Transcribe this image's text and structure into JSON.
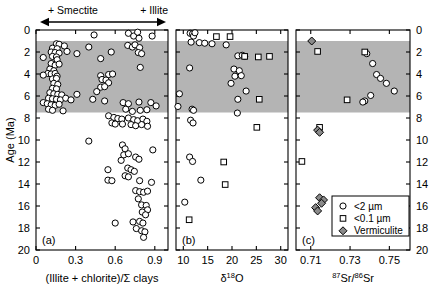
{
  "figure": {
    "yaxis": {
      "label": "Age (Ma)",
      "ticks": [
        0,
        2,
        4,
        6,
        8,
        10,
        12,
        14,
        16,
        18,
        20
      ],
      "min": 0,
      "max": 20,
      "direction": "inverted"
    },
    "shaded_band": {
      "label": "",
      "y_top": 1.0,
      "y_bottom": 7.5,
      "color": "#b4b4b4"
    },
    "annotations": {
      "left_arrow_label": "+ Smectite",
      "right_arrow_label": "+ Illite"
    },
    "legend": {
      "items": [
        {
          "symbol": "circle",
          "label": "<2 µm"
        },
        {
          "symbol": "square",
          "label": "<0.1 µm"
        },
        {
          "symbol": "diamond",
          "label": "Vermiculite"
        }
      ]
    }
  },
  "chart_data": [
    {
      "type": "scatter",
      "panel": "(a)",
      "title": "",
      "xlabel": "(Illite + chlorite)/Σ clays",
      "ylabel": "Age (Ma)",
      "xlim": [
        0,
        1.0
      ],
      "ylim": [
        20,
        0
      ],
      "xticks": [
        0,
        0.3,
        0.6,
        0.9
      ],
      "xticklabels": [
        "0",
        "0.3",
        "0.6",
        "0.9"
      ],
      "yticks": [
        0,
        2,
        4,
        6,
        8,
        10,
        12,
        14,
        16,
        18,
        20
      ],
      "grid": false,
      "series": [
        {
          "name": "<2 µm",
          "symbol": "circle",
          "points": [
            [
              0.44,
              0.45
            ],
            [
              0.7,
              0.3
            ],
            [
              0.74,
              0.55
            ],
            [
              0.77,
              0.2
            ],
            [
              0.78,
              0.75
            ],
            [
              0.88,
              0.55
            ],
            [
              0.155,
              1.25
            ],
            [
              0.175,
              1.3
            ],
            [
              0.215,
              1.45
            ],
            [
              0.125,
              1.65
            ],
            [
              0.16,
              1.7
            ],
            [
              0.695,
              1.4
            ],
            [
              0.73,
              1.55
            ],
            [
              0.75,
              1.35
            ],
            [
              0.785,
              1.6
            ],
            [
              0.4,
              1.55
            ],
            [
              0.235,
              1.95
            ],
            [
              0.115,
              2.0
            ],
            [
              0.145,
              2.05
            ],
            [
              0.175,
              2.1
            ],
            [
              0.055,
              2.5
            ],
            [
              0.31,
              2.15
            ],
            [
              0.57,
              2.0
            ],
            [
              0.775,
              2.05
            ],
            [
              0.8,
              2.15
            ],
            [
              0.125,
              2.4
            ],
            [
              0.155,
              2.45
            ],
            [
              0.16,
              2.7
            ],
            [
              0.49,
              2.6
            ],
            [
              0.115,
              3.05
            ],
            [
              0.145,
              3.2
            ],
            [
              0.175,
              3.1
            ],
            [
              0.105,
              3.55
            ],
            [
              0.135,
              3.7
            ],
            [
              0.79,
              3.4
            ],
            [
              0.09,
              3.95
            ],
            [
              0.115,
              4.0
            ],
            [
              0.145,
              3.95
            ],
            [
              0.055,
              4.1
            ],
            [
              0.16,
              4.2
            ],
            [
              0.49,
              4.15
            ],
            [
              0.55,
              4.05
            ],
            [
              0.58,
              4.0
            ],
            [
              0.125,
              4.45
            ],
            [
              0.155,
              4.4
            ],
            [
              0.5,
              4.5
            ],
            [
              0.53,
              4.55
            ],
            [
              0.135,
              4.85
            ],
            [
              0.165,
              4.95
            ],
            [
              0.55,
              4.8
            ],
            [
              0.125,
              5.3
            ],
            [
              0.155,
              5.35
            ],
            [
              0.49,
              5.2
            ],
            [
              0.52,
              5.15
            ],
            [
              0.105,
              5.7
            ],
            [
              0.135,
              5.8
            ],
            [
              0.165,
              5.85
            ],
            [
              0.195,
              5.9
            ],
            [
              0.31,
              5.85
            ],
            [
              0.46,
              5.6
            ],
            [
              0.095,
              6.2
            ],
            [
              0.125,
              6.25
            ],
            [
              0.155,
              6.3
            ],
            [
              0.185,
              6.35
            ],
            [
              0.225,
              6.2
            ],
            [
              0.265,
              6.35
            ],
            [
              0.43,
              6.3
            ],
            [
              0.52,
              6.45
            ],
            [
              0.055,
              6.6
            ],
            [
              0.085,
              6.7
            ],
            [
              0.115,
              6.8
            ],
            [
              0.145,
              6.85
            ],
            [
              0.175,
              6.75
            ],
            [
              0.66,
              6.6
            ],
            [
              0.7,
              6.7
            ],
            [
              0.78,
              6.55
            ],
            [
              0.87,
              6.6
            ],
            [
              0.91,
              6.9
            ],
            [
              0.095,
              7.2
            ],
            [
              0.125,
              7.3
            ],
            [
              0.205,
              7.35
            ],
            [
              0.68,
              7.2
            ],
            [
              0.73,
              7.4
            ],
            [
              0.79,
              7.3
            ],
            [
              0.84,
              7.25
            ],
            [
              0.55,
              7.8
            ],
            [
              0.59,
              7.95
            ],
            [
              0.62,
              8.05
            ],
            [
              0.65,
              8.1
            ],
            [
              0.7,
              8.0
            ],
            [
              0.74,
              8.15
            ],
            [
              0.77,
              8.25
            ],
            [
              0.81,
              8.1
            ],
            [
              0.84,
              8.3
            ],
            [
              0.575,
              8.45
            ],
            [
              0.6,
              8.55
            ],
            [
              0.655,
              8.55
            ],
            [
              0.72,
              8.6
            ],
            [
              0.755,
              8.7
            ],
            [
              0.8,
              8.6
            ],
            [
              0.845,
              8.75
            ],
            [
              0.4,
              10.1
            ],
            [
              0.655,
              10.45
            ],
            [
              0.675,
              10.8
            ],
            [
              0.885,
              10.9
            ],
            [
              0.665,
              11.35
            ],
            [
              0.7,
              11.25
            ],
            [
              0.755,
              11.55
            ],
            [
              0.645,
              11.85
            ],
            [
              0.78,
              11.75
            ],
            [
              0.545,
              12.7
            ],
            [
              0.695,
              12.55
            ],
            [
              0.72,
              12.7
            ],
            [
              0.745,
              12.85
            ],
            [
              0.675,
              13.25
            ],
            [
              0.7,
              13.35
            ],
            [
              0.545,
              13.65
            ],
            [
              0.575,
              13.7
            ],
            [
              0.785,
              13.7
            ],
            [
              0.875,
              13.85
            ],
            [
              0.755,
              14.6
            ],
            [
              0.785,
              14.7
            ],
            [
              0.815,
              14.75
            ],
            [
              0.845,
              14.65
            ],
            [
              0.775,
              15.35
            ],
            [
              0.8,
              15.9
            ],
            [
              0.835,
              15.95
            ],
            [
              0.845,
              16.35
            ],
            [
              0.805,
              16.55
            ],
            [
              0.83,
              16.8
            ],
            [
              0.6,
              17.55
            ],
            [
              0.735,
              17.45
            ],
            [
              0.785,
              17.4
            ],
            [
              0.81,
              17.55
            ],
            [
              0.76,
              18.05
            ],
            [
              0.8,
              18.25
            ],
            [
              0.825,
              18.35
            ],
            [
              0.815,
              18.85
            ]
          ]
        }
      ]
    },
    {
      "type": "scatter",
      "panel": "(b)",
      "title": "",
      "xlabel": "δ18O",
      "xlabel_display": "δ¹⁸O",
      "ylabel": "Age (Ma)",
      "xlim": [
        8.5,
        31.5
      ],
      "ylim": [
        20,
        0
      ],
      "xticks": [
        10,
        15,
        20,
        25,
        30
      ],
      "xticklabels": [
        "10",
        "15",
        "20",
        "25",
        "30"
      ],
      "yticks": [
        0,
        2,
        4,
        6,
        8,
        10,
        12,
        14,
        16,
        18,
        20
      ],
      "grid": false,
      "series": [
        {
          "name": "<2 µm",
          "symbol": "circle",
          "points": [
            [
              11.4,
              0.3
            ],
            [
              11.9,
              0.35
            ],
            [
              12.1,
              0.55
            ],
            [
              12.4,
              0.25
            ],
            [
              11.6,
              1.1
            ],
            [
              13.3,
              1.15
            ],
            [
              14.4,
              1.2
            ],
            [
              15.9,
              1.25
            ],
            [
              18.8,
              1.35
            ],
            [
              21.2,
              2.35
            ],
            [
              22.1,
              2.3
            ],
            [
              22.6,
              2.4
            ],
            [
              11.3,
              3.45
            ],
            [
              20.4,
              3.55
            ],
            [
              21.5,
              3.7
            ],
            [
              20.6,
              4.2
            ],
            [
              21.9,
              4.15
            ],
            [
              19.8,
              4.85
            ],
            [
              9.2,
              5.8
            ],
            [
              22.9,
              5.55
            ],
            [
              21.2,
              6.3
            ],
            [
              8.9,
              6.95
            ],
            [
              11.8,
              7.2
            ],
            [
              12.1,
              7.3
            ],
            [
              21.1,
              7.55
            ],
            [
              11.5,
              8.2
            ],
            [
              12.0,
              8.45
            ],
            [
              11.3,
              11.55
            ],
            [
              11.9,
              11.95
            ],
            [
              13.6,
              13.65
            ],
            [
              10.3,
              15.65
            ]
          ]
        },
        {
          "name": "<0.1 µm",
          "symbol": "square",
          "points": [
            [
              16.8,
              0.6
            ],
            [
              19.6,
              0.6
            ],
            [
              22.6,
              2.4
            ],
            [
              25.4,
              2.45
            ],
            [
              27.7,
              2.4
            ],
            [
              25.6,
              6.3
            ],
            [
              25.1,
              8.85
            ],
            [
              18.3,
              12.0
            ],
            [
              18.6,
              14.05
            ],
            [
              11.2,
              17.25
            ]
          ]
        }
      ]
    },
    {
      "type": "scatter",
      "panel": "(c)",
      "title": "",
      "xlabel": "87Sr/86Sr",
      "xlabel_display": "⁸⁷Sr/⁸⁶Sr",
      "xlim": [
        0.7025,
        0.7605
      ],
      "ylim": [
        20,
        0
      ],
      "xticks": [
        0.71,
        0.73,
        0.75
      ],
      "xticklabels": [
        "0.71",
        "0.73",
        "0.75"
      ],
      "yticks": [
        0,
        2,
        4,
        6,
        8,
        10,
        12,
        14,
        16,
        18,
        20
      ],
      "grid": false,
      "series": [
        {
          "name": "<2 µm",
          "symbol": "circle",
          "points": [
            [
              0.7385,
              2.15
            ],
            [
              0.7415,
              3.05
            ],
            [
              0.7435,
              4.05
            ],
            [
              0.7455,
              4.4
            ],
            [
              0.7485,
              4.85
            ],
            [
              0.7525,
              5.55
            ],
            [
              0.7405,
              5.95
            ],
            [
              0.7375,
              6.45
            ],
            [
              0.7365,
              6.55
            ]
          ]
        },
        {
          "name": "<0.1 µm",
          "symbol": "square",
          "points": [
            [
              0.7135,
              1.95
            ],
            [
              0.7375,
              2.0
            ],
            [
              0.7285,
              6.35
            ],
            [
              0.7145,
              8.85
            ],
            [
              0.7055,
              11.95
            ]
          ]
        },
        {
          "name": "Vermiculite",
          "symbol": "diamond",
          "points": [
            [
              0.7105,
              1.0
            ],
            [
              0.7135,
              9.1
            ],
            [
              0.7145,
              9.3
            ],
            [
              0.7145,
              15.25
            ],
            [
              0.7165,
              15.45
            ],
            [
              0.7155,
              15.75
            ],
            [
              0.7125,
              16.15
            ],
            [
              0.7135,
              16.45
            ]
          ]
        }
      ]
    }
  ]
}
